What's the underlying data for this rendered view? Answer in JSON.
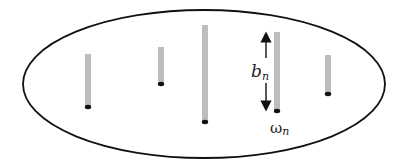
{
  "diagram": {
    "colors": {
      "outline": "#111111",
      "bar": "#bdbdbd",
      "dot": "#111111",
      "arrow": "#111111"
    },
    "bars": [
      {
        "id": "bar-1"
      },
      {
        "id": "bar-2"
      },
      {
        "id": "bar-3"
      },
      {
        "id": "bar-4",
        "annotated": true
      },
      {
        "id": "bar-5"
      }
    ],
    "labels": {
      "length_base": "b",
      "length_sub": "n",
      "freq_base": "ω",
      "freq_sub": "n"
    }
  }
}
